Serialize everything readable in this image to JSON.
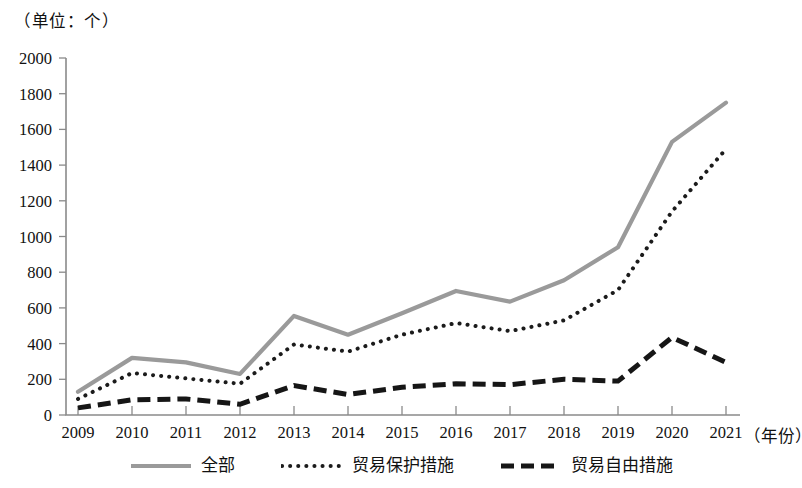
{
  "caption": {
    "unit": "（单位：个）",
    "xaxis_unit": "（年份）"
  },
  "legend": {
    "items": [
      {
        "label": "全部",
        "style": "solid-gray",
        "color": "#9a9a9a"
      },
      {
        "label": "贸易保护措施",
        "style": "dotted-black",
        "color": "#1b1b1b"
      },
      {
        "label": "贸易自由措施",
        "style": "dashed-black",
        "color": "#161616"
      }
    ]
  },
  "chart_data": {
    "type": "line",
    "title": "",
    "subtitle": "",
    "xlabel": "（年份）",
    "ylabel": "（单位：个）",
    "categories": [
      "2009",
      "2010",
      "2011",
      "2012",
      "2013",
      "2014",
      "2015",
      "2016",
      "2017",
      "2018",
      "2019",
      "2020",
      "2021"
    ],
    "x": [
      2009,
      2010,
      2011,
      2012,
      2013,
      2014,
      2015,
      2016,
      2017,
      2018,
      2019,
      2020,
      2021
    ],
    "xlim": [
      2009,
      2021
    ],
    "ylim": [
      0,
      2000
    ],
    "ytick_labels": [
      "0",
      "200",
      "400",
      "600",
      "800",
      "1000",
      "1200",
      "1400",
      "1600",
      "1800",
      "2000"
    ],
    "yticks": [
      0,
      200,
      400,
      600,
      800,
      1000,
      1200,
      1400,
      1600,
      1800,
      2000
    ],
    "grid": false,
    "legend_position": "bottom",
    "series": [
      {
        "name": "全部",
        "style": "solid",
        "color": "#9a9a9a",
        "values": [
          130,
          320,
          295,
          230,
          555,
          450,
          570,
          695,
          635,
          755,
          940,
          1530,
          1750
        ]
      },
      {
        "name": "贸易保护措施",
        "style": "dotted",
        "color": "#1b1b1b",
        "values": [
          90,
          235,
          205,
          175,
          395,
          355,
          450,
          515,
          470,
          530,
          700,
          1140,
          1490
        ]
      },
      {
        "name": "贸易自由措施",
        "style": "dashed",
        "color": "#161616",
        "values": [
          40,
          85,
          90,
          60,
          165,
          115,
          155,
          175,
          170,
          200,
          190,
          435,
          295
        ]
      }
    ]
  }
}
